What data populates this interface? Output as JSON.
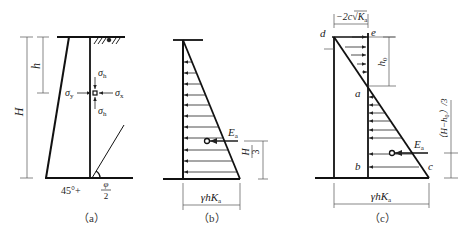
{
  "figure": {
    "panels": [
      {
        "id": "a",
        "caption": "（a）",
        "labels": {
          "H": "H",
          "h": "h",
          "sigma_h_top": "σ",
          "sigma_h_top_sub": "h",
          "sigma_h_bottom": "σ",
          "sigma_h_bottom_sub": "h",
          "sigma_y": "σ",
          "sigma_y_sub": "y",
          "sigma_x": "σ",
          "sigma_x_sub": "x",
          "angle_prefix": "45°+",
          "angle_num": "φ",
          "angle_den": "2"
        }
      },
      {
        "id": "b",
        "caption": "（b）",
        "labels": {
          "Ea": "E",
          "Ea_sub": "a",
          "H_num": "H",
          "H_den": "3",
          "base": "γhK",
          "base_sub": "a"
        }
      },
      {
        "id": "c",
        "caption": "（c）",
        "labels": {
          "top_dim": "−2c√K",
          "top_dim_sub": "a",
          "d": "d",
          "e": "e",
          "a": "a",
          "b": "b",
          "c": "c",
          "h0": "h",
          "h0_sub": "0",
          "right_dim": "（H−h",
          "right_dim_sub": "0",
          "right_dim_tail": "）/3",
          "Ea": "E",
          "Ea_sub": "a",
          "base": "γhK",
          "base_sub": "a"
        }
      }
    ]
  }
}
